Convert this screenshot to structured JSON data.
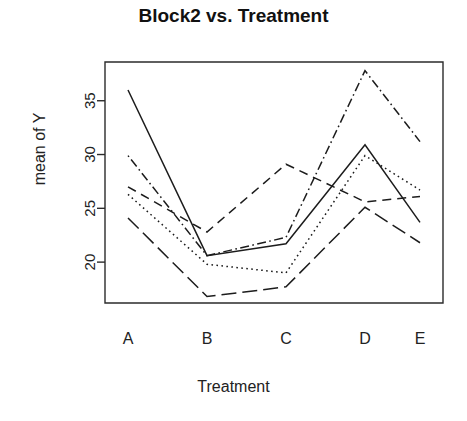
{
  "chart_data": {
    "type": "line",
    "title": "Block2 vs. Treatment",
    "xlabel": "Treatment",
    "ylabel": "mean of  Y",
    "categories": [
      "A",
      "B",
      "C",
      "D",
      "E"
    ],
    "ytick_labels": [
      "20",
      "25",
      "30",
      "35"
    ],
    "ytick_values": [
      20,
      25,
      30,
      35
    ],
    "ylim": [
      16.2,
      38.6
    ],
    "grid": false,
    "legend": false,
    "legend_position": "none",
    "series": [
      {
        "name": "series-1",
        "line_style": "solid",
        "color": "#1c1c1c",
        "values": [
          36.0,
          20.6,
          21.7,
          30.9,
          23.7
        ]
      },
      {
        "name": "series-2",
        "line_style": "dotted",
        "color": "#1c1c1c",
        "values": [
          26.3,
          19.8,
          19.0,
          29.9,
          26.7
        ]
      },
      {
        "name": "series-3",
        "line_style": "dashed",
        "color": "#1c1c1c",
        "values": [
          27.0,
          22.8,
          29.1,
          25.6,
          26.1
        ]
      },
      {
        "name": "series-4",
        "line_style": "dotdash",
        "color": "#1c1c1c",
        "values": [
          29.9,
          20.6,
          22.3,
          37.8,
          31.2
        ]
      },
      {
        "name": "series-5",
        "line_style": "longdash",
        "color": "#1c1c1c",
        "values": [
          24.1,
          16.8,
          17.7,
          25.1,
          21.8
        ]
      }
    ],
    "axis_box": {
      "left": 105,
      "right": 443,
      "top": 62,
      "bottom": 303
    },
    "category_x": [
      128,
      207,
      286,
      365,
      420
    ]
  }
}
